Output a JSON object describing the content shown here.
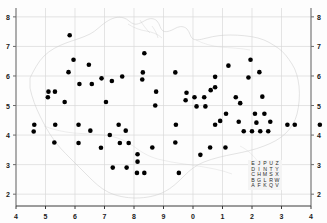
{
  "figure": {
    "width": 327,
    "height": 223,
    "background_color": "#fdfdfd"
  },
  "chart_data": {
    "type": "scatter",
    "title": "",
    "subtitle": "",
    "xlabel": "",
    "ylabel": "",
    "xlim": [
      4,
      14
    ],
    "ylim": [
      1.6,
      8.3
    ],
    "grid": true,
    "legend_position": "bottom-right",
    "marker": {
      "shape": "circle",
      "color": "#000000",
      "size_px": 4.6
    },
    "x_tick_values": [
      4,
      5,
      6,
      7,
      8,
      9,
      10,
      11,
      12,
      13,
      14
    ],
    "x_tick_labels": [
      "4",
      "5",
      "6",
      "7",
      "8",
      "9",
      "0",
      "1",
      "2",
      "3",
      "4"
    ],
    "y_tick_values": [
      2,
      3,
      4,
      5,
      6,
      7,
      8
    ],
    "y_tick_labels_left": [
      "8",
      "7",
      "6",
      "5",
      "4",
      "3",
      "2"
    ],
    "y_tick_labels_right": [
      "8",
      "7",
      "6",
      "5",
      "4",
      "3",
      "2"
    ],
    "points": [
      [
        5.82,
        7.38
      ],
      [
        5.95,
        6.55
      ],
      [
        8.35,
        6.77
      ],
      [
        6.47,
        6.38
      ],
      [
        5.78,
        6.13
      ],
      [
        8.3,
        6.12
      ],
      [
        6.9,
        5.92
      ],
      [
        9.4,
        6.12
      ],
      [
        11.2,
        6.35
      ],
      [
        11.95,
        6.55
      ],
      [
        12.25,
        6.13
      ],
      [
        11.88,
        5.95
      ],
      [
        6.15,
        5.73
      ],
      [
        6.57,
        5.73
      ],
      [
        7.25,
        5.83
      ],
      [
        7.6,
        5.98
      ],
      [
        8.28,
        5.88
      ],
      [
        10.75,
        5.97
      ],
      [
        10.75,
        5.62
      ],
      [
        8.75,
        5.47
      ],
      [
        9.78,
        5.43
      ],
      [
        10.6,
        5.52
      ],
      [
        5.1,
        5.47
      ],
      [
        5.32,
        5.47
      ],
      [
        5.08,
        5.28
      ],
      [
        5.65,
        5.12
      ],
      [
        7.05,
        5.12
      ],
      [
        8.72,
        5.0
      ],
      [
        9.75,
        5.18
      ],
      [
        10.05,
        5.28
      ],
      [
        10.38,
        5.28
      ],
      [
        10.12,
        4.97
      ],
      [
        10.42,
        4.97
      ],
      [
        11.45,
        5.28
      ],
      [
        12.35,
        5.3
      ],
      [
        11.6,
        5.08
      ],
      [
        11.12,
        4.72
      ],
      [
        10.92,
        4.48
      ],
      [
        11.55,
        4.45
      ],
      [
        12.1,
        4.72
      ],
      [
        12.42,
        4.72
      ],
      [
        12.15,
        4.42
      ],
      [
        12.62,
        4.45
      ],
      [
        4.62,
        4.35
      ],
      [
        4.6,
        4.12
      ],
      [
        5.33,
        4.35
      ],
      [
        6.12,
        4.35
      ],
      [
        6.52,
        4.15
      ],
      [
        7.48,
        4.35
      ],
      [
        7.72,
        4.15
      ],
      [
        9.42,
        4.35
      ],
      [
        10.75,
        4.35
      ],
      [
        13.2,
        4.35
      ],
      [
        13.45,
        4.35
      ],
      [
        14.3,
        4.35
      ],
      [
        11.72,
        4.13
      ],
      [
        12.0,
        4.13
      ],
      [
        12.28,
        4.13
      ],
      [
        12.55,
        4.13
      ],
      [
        7.18,
        4.0
      ],
      [
        5.3,
        3.75
      ],
      [
        6.12,
        3.73
      ],
      [
        7.52,
        3.73
      ],
      [
        7.82,
        3.73
      ],
      [
        9.4,
        3.75
      ],
      [
        8.62,
        3.58
      ],
      [
        6.88,
        3.57
      ],
      [
        10.58,
        3.58
      ],
      [
        11.1,
        3.58
      ],
      [
        10.25,
        3.33
      ],
      [
        8.12,
        3.35
      ],
      [
        8.12,
        3.1
      ],
      [
        7.28,
        2.9
      ],
      [
        7.75,
        2.9
      ],
      [
        8.1,
        2.72
      ],
      [
        8.35,
        2.72
      ],
      [
        9.52,
        2.72
      ]
    ]
  },
  "grid_key": {
    "name": "national-grid-letter-square",
    "rows": [
      [
        "E",
        "J",
        "P",
        "U",
        "Z"
      ],
      [
        "D",
        "I",
        "N",
        "T",
        "Y"
      ],
      [
        "C",
        "H",
        "M",
        "S",
        "X"
      ],
      [
        "B",
        "G",
        "L",
        "R",
        "W"
      ],
      [
        "A",
        "F",
        "K",
        "Q",
        "V"
      ]
    ],
    "background_color": "#f4f4f4"
  },
  "styling": {
    "grid_line_color": "#d8d8d8",
    "coastline_color": "#c9c9c9",
    "axis_color": "#6b6b6b",
    "tick_label_color": "#1a1a1a",
    "point_color": "#000000"
  }
}
